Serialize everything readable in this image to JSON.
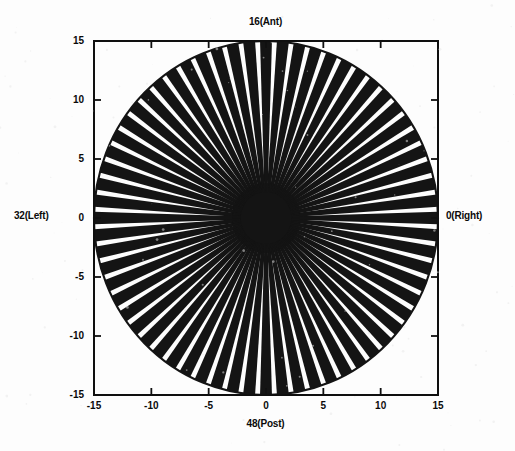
{
  "figure": {
    "title": "",
    "background_color": "#fdfdfd",
    "line_color": "#141414",
    "axis_color": "#101010"
  },
  "labels": {
    "top": "16(Ant)",
    "bottom": "48(Post)",
    "left": "32(Left)",
    "right": "0(Right)"
  },
  "axes": {
    "x_ticks": [
      "-15",
      "-10",
      "-5",
      "0",
      "5",
      "10",
      "15"
    ],
    "y_ticks": [
      "15",
      "10",
      "5",
      "0",
      "-5",
      "-10",
      "-15"
    ],
    "x_tick_values": [
      -15,
      -10,
      -5,
      0,
      5,
      10,
      15
    ],
    "y_tick_values": [
      15,
      10,
      5,
      0,
      -5,
      -10,
      -15
    ],
    "xlim": [
      -15,
      15
    ],
    "ylim": [
      -15,
      15
    ],
    "box": true,
    "grid": false,
    "tick_direction": "in"
  },
  "chart_data": {
    "type": "line",
    "title": "",
    "subtitle": "",
    "xlabel": "48(Post)",
    "ylabel": "",
    "xlim": [
      -15,
      15
    ],
    "ylim": [
      -15,
      15
    ],
    "grid": false,
    "legend": "none",
    "n_spokes": 64,
    "spoke_radius": 15,
    "spoke_index_labels": {
      "0": "0(Right)",
      "16": "16(Ant)",
      "32": "32(Left)",
      "48": "48(Post)"
    },
    "center": [
      0,
      0
    ],
    "core_radius": 2.4,
    "spoke_angles_deg": [
      0,
      5.625,
      11.25,
      16.875,
      22.5,
      28.125,
      33.75,
      39.375,
      45,
      50.625,
      56.25,
      61.875,
      67.5,
      73.125,
      78.75,
      84.375,
      90,
      95.625,
      101.25,
      106.875,
      112.5,
      118.125,
      123.75,
      129.375,
      135,
      140.625,
      146.25,
      151.875,
      157.5,
      163.125,
      168.75,
      174.375,
      180,
      185.625,
      191.25,
      196.875,
      202.5,
      208.125,
      213.75,
      219.375,
      225,
      230.625,
      236.25,
      241.875,
      247.5,
      253.125,
      258.75,
      264.375,
      270,
      275.625,
      281.25,
      286.875,
      292.5,
      298.125,
      303.75,
      309.375,
      315,
      320.625,
      326.25,
      331.875,
      337.5,
      343.125,
      348.75,
      354.375
    ],
    "series": [
      {
        "name": "spokes",
        "values": [
          15,
          15,
          15,
          15,
          15,
          15,
          15,
          15,
          15,
          15,
          15,
          15,
          15,
          15,
          15,
          15,
          15,
          15,
          15,
          15,
          15,
          15,
          15,
          15,
          15,
          15,
          15,
          15,
          15,
          15,
          15,
          15,
          15,
          15,
          15,
          15,
          15,
          15,
          15,
          15,
          15,
          15,
          15,
          15,
          15,
          15,
          15,
          15,
          15,
          15,
          15,
          15,
          15,
          15,
          15,
          15,
          15,
          15,
          15,
          15,
          15,
          15,
          15,
          15
        ]
      }
    ]
  }
}
